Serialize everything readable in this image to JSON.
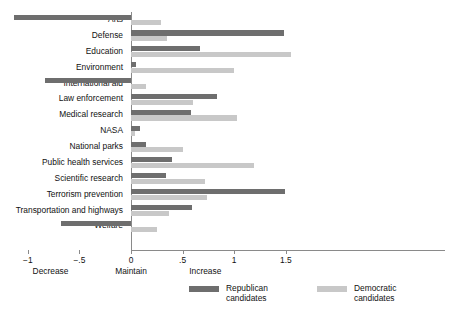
{
  "chart_data": {
    "type": "bar",
    "orientation": "horizontal",
    "title": "",
    "subtitle": "",
    "xlabel": "",
    "ylabel": "",
    "xlim": [
      -1.25,
      1.68
    ],
    "grid": false,
    "legend_position": "bottom",
    "zero_line_label": "Maintain",
    "categories": [
      "Arts",
      "Defense",
      "Education",
      "Environment",
      "International aid",
      "Law enforcement",
      "Medical research",
      "NASA",
      "National parks",
      "Public health services",
      "Scientific research",
      "Terrorism prevention",
      "Transportation and highways",
      "Welfare"
    ],
    "series": [
      {
        "name": "Republican candidates",
        "color": "#6e6e6e",
        "values": [
          -1.13,
          1.48,
          0.67,
          0.05,
          -0.83,
          0.83,
          0.58,
          0.09,
          0.15,
          0.4,
          0.34,
          1.49,
          0.59,
          -0.68
        ]
      },
      {
        "name": "Democratic candidates",
        "color": "#c8c8c8",
        "values": [
          0.29,
          0.35,
          1.55,
          1.0,
          0.15,
          0.6,
          1.03,
          0.04,
          0.5,
          1.19,
          0.72,
          0.74,
          0.37,
          0.25
        ]
      }
    ],
    "xticks": [
      {
        "value": -1,
        "label": "−1"
      },
      {
        "value": -0.5,
        "label": "−.5"
      },
      {
        "value": 0,
        "label": "0"
      },
      {
        "value": 0.5,
        "label": ".5"
      },
      {
        "value": 1,
        "label": "1"
      },
      {
        "value": 1.5,
        "label": "1.5"
      }
    ],
    "anchor_labels": [
      {
        "value": -0.78,
        "label": "Decrease"
      },
      {
        "value": 0.0,
        "label": "Maintain"
      },
      {
        "value": 0.72,
        "label": "Increase"
      }
    ],
    "legend": [
      {
        "label": "Republican\ncandidates",
        "color": "#6e6e6e"
      },
      {
        "label": "Democratic\ncandidates",
        "color": "#c8c8c8"
      }
    ]
  }
}
